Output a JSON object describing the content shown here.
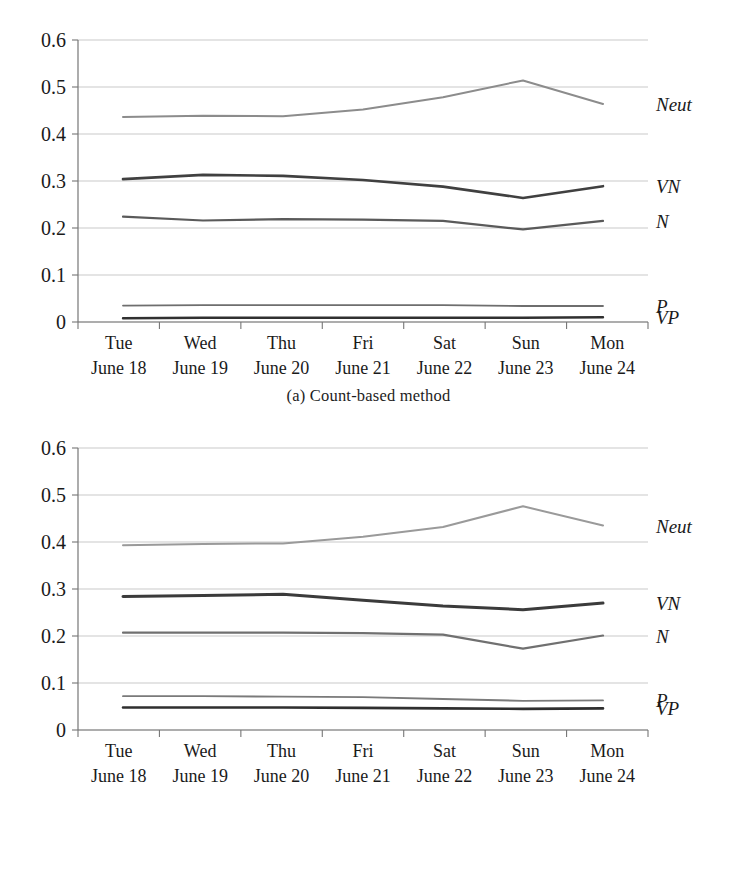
{
  "figure": {
    "panels": [
      {
        "id": "a",
        "caption": "(a) Count-based method"
      },
      {
        "id": "b",
        "caption": "(b) Score-based method"
      }
    ]
  },
  "chart_data": [
    {
      "type": "line",
      "title": "(a) Count-based method",
      "xlabel": "",
      "ylabel": "",
      "ylim": [
        0,
        0.6
      ],
      "yticks": [
        "0",
        "0.1",
        "0.2",
        "0.3",
        "0.4",
        "0.5",
        "0.6"
      ],
      "ytick_values": [
        0,
        0.1,
        0.2,
        0.3,
        0.4,
        0.5,
        0.6
      ],
      "grid": true,
      "legend_position": "right-inline-labels",
      "categories": [
        "Tue",
        "Wed",
        "Thu",
        "Fri",
        "Sat",
        "Sun",
        "Mon"
      ],
      "category_sublabels": [
        "June 18",
        "June 19",
        "June 20",
        "June 21",
        "June 22",
        "June 23",
        "June 24"
      ],
      "series": [
        {
          "name": "Neut",
          "label": "Neut",
          "color": "#8c8c8c",
          "width": 2.0,
          "values": [
            0.436,
            0.439,
            0.438,
            0.452,
            0.478,
            0.514,
            0.464
          ]
        },
        {
          "name": "VN",
          "label": "VN",
          "color": "#404040",
          "width": 2.6,
          "values": [
            0.304,
            0.313,
            0.311,
            0.302,
            0.288,
            0.264,
            0.289
          ]
        },
        {
          "name": "N",
          "label": "N",
          "color": "#5a5a5a",
          "width": 2.2,
          "values": [
            0.224,
            0.216,
            0.219,
            0.218,
            0.215,
            0.197,
            0.215
          ]
        },
        {
          "name": "P",
          "label": "P",
          "color": "#6e6e6e",
          "width": 1.8,
          "values": [
            0.035,
            0.036,
            0.036,
            0.036,
            0.036,
            0.034,
            0.034
          ]
        },
        {
          "name": "VP",
          "label": "VP",
          "color": "#303030",
          "width": 2.4,
          "values": [
            0.008,
            0.009,
            0.009,
            0.009,
            0.009,
            0.009,
            0.01
          ]
        }
      ]
    },
    {
      "type": "line",
      "title": "(b) Score-based method",
      "xlabel": "",
      "ylabel": "",
      "ylim": [
        0,
        0.6
      ],
      "yticks": [
        "0",
        "0.1",
        "0.2",
        "0.3",
        "0.4",
        "0.5",
        "0.6"
      ],
      "ytick_values": [
        0,
        0.1,
        0.2,
        0.3,
        0.4,
        0.5,
        0.6
      ],
      "grid": true,
      "legend_position": "right-inline-labels",
      "categories": [
        "Tue",
        "Wed",
        "Thu",
        "Fri",
        "Sat",
        "Sun",
        "Mon"
      ],
      "category_sublabels": [
        "June 18",
        "June 19",
        "June 20",
        "June 21",
        "June 22",
        "June 23",
        "June 24"
      ],
      "series": [
        {
          "name": "Neut",
          "label": "Neut",
          "color": "#9a9a9a",
          "width": 2.0,
          "values": [
            0.393,
            0.396,
            0.397,
            0.411,
            0.432,
            0.476,
            0.435
          ]
        },
        {
          "name": "VN",
          "label": "VN",
          "color": "#3b3b3b",
          "width": 3.0,
          "values": [
            0.284,
            0.286,
            0.289,
            0.276,
            0.264,
            0.256,
            0.27
          ]
        },
        {
          "name": "N",
          "label": "N",
          "color": "#707070",
          "width": 2.2,
          "values": [
            0.207,
            0.207,
            0.207,
            0.206,
            0.203,
            0.173,
            0.201
          ]
        },
        {
          "name": "P",
          "label": "P",
          "color": "#7a7a7a",
          "width": 1.9,
          "values": [
            0.072,
            0.072,
            0.071,
            0.07,
            0.066,
            0.062,
            0.063
          ]
        },
        {
          "name": "VP",
          "label": "VP",
          "color": "#2f2f2f",
          "width": 2.6,
          "values": [
            0.048,
            0.048,
            0.048,
            0.047,
            0.046,
            0.045,
            0.046
          ]
        }
      ]
    }
  ]
}
